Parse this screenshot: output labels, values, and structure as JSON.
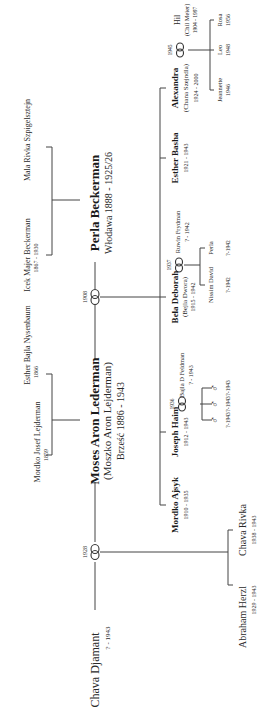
{
  "diagram": {
    "type": "family-tree",
    "orientation": "rotated-90-ccw",
    "great_grandparents": {
      "paternal": [
        {
          "name": "Mordko Josef Lejderman",
          "dates": "1859"
        },
        {
          "name": "Esther Bajla Nysenbaum",
          "dates": "1866"
        }
      ],
      "maternal": [
        {
          "name": "Icek Majer Beckerman",
          "dates": "1867 - 1930"
        },
        {
          "name": "Mala Rivka Szpigelsztejn",
          "dates": ""
        }
      ]
    },
    "couple": {
      "husband": {
        "name": "Moses Aron Lederman",
        "alias": "(Moszko Aron Lejderman)",
        "place_dates": "Brześć 1886 - 1943"
      },
      "first_wife": {
        "name": "Chava Djamant",
        "dates": "? - 1943"
      },
      "first_marriage_year": "1928",
      "second_wife": {
        "name": "Perla Beckerman",
        "place_dates": "Włodawa 1888 - 1925/26"
      },
      "second_marriage_year": "1908"
    },
    "children_first_marriage": [
      {
        "name": "Abraham Herzl",
        "dates": "1929 - 1943"
      },
      {
        "name": "Chava Rivka",
        "dates": "1938 - 1943"
      }
    ],
    "children_second_marriage": [
      {
        "name": "Mordko Ajsyk",
        "dates": "1910 - 1935"
      },
      {
        "name": "Joseph Haim",
        "dates": "1912 - 1943",
        "marriage_year": "1936",
        "spouse": {
          "name": "Bajla D Feldman",
          "dates": "? - 1943"
        },
        "children": [
          {
            "symbol": "♂",
            "dates": "?-1943"
          },
          {
            "symbol": "♂",
            "dates": "?-1943"
          },
          {
            "symbol": "♂",
            "dates": "?-1943"
          }
        ]
      },
      {
        "name": "Bela Deborah",
        "alias": "(Bejla Dwora)",
        "dates": "1915 - 1942",
        "marriage_year": "1937",
        "spouse": {
          "name": "Ruwin Frydman",
          "dates": "? - 1942"
        },
        "children": [
          {
            "name": "Nissim David",
            "dates": "?-1942"
          },
          {
            "name": "Perla",
            "dates": "?-1942"
          }
        ]
      },
      {
        "name": "Esther Basha",
        "dates": "1921 - 1943"
      },
      {
        "name": "Alexandra",
        "alias": "(Chana Szejndla)",
        "dates": "1924 - 2000",
        "marriage_year": "1945",
        "spouse": {
          "name": "Hil",
          "alias": "(Chil Meier)",
          "dates": "1904 - 1997"
        },
        "children": [
          {
            "name": "Jeannette",
            "dates": "1946"
          },
          {
            "name": "Leo",
            "dates": "1948"
          },
          {
            "name": "Rosa",
            "dates": "1956"
          }
        ]
      }
    ]
  },
  "colors": {
    "line": "#444444",
    "text": "#2a2a2a",
    "background": "#ffffff"
  }
}
